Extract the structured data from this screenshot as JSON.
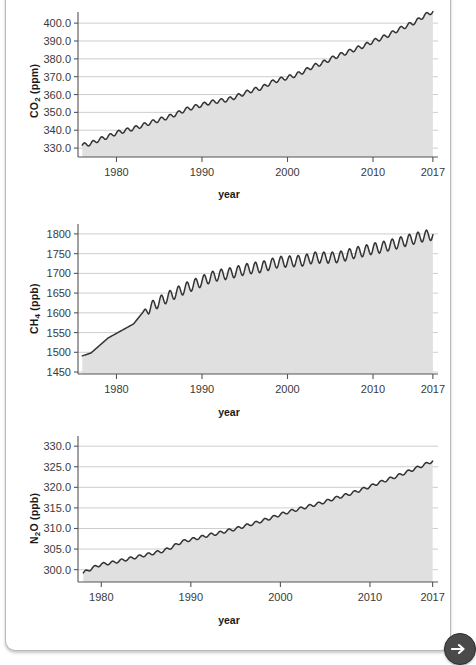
{
  "page": {
    "clipped_heading": "Atmospheric concentrations of carbon dioxide (CO2), methane (CH4) and nitrous oxide (N2O)",
    "next_button_label": "Next",
    "next_icon": "arrow-right-icon",
    "colors": {
      "area_fill": "#e0e0e0",
      "line": "#333333",
      "grid": "#c8c8c8",
      "axis": "#555555",
      "text": "#3a3a3a",
      "button_bg": "#4a4a4a"
    }
  },
  "chart_data": [
    {
      "id": "co2",
      "type": "area",
      "title": "",
      "ylabel": "CO2 (ppm)",
      "ylabel_html": "CO<sub>2</sub> (ppm)",
      "xlabel": "year",
      "unit": "ppm",
      "xlim": [
        1975.5,
        2017.6
      ],
      "ylim": [
        325.0,
        404.0
      ],
      "xticks": [
        1980,
        1990,
        2000,
        2010,
        2017
      ],
      "yticks": [
        330.0,
        340.0,
        350.0,
        360.0,
        370.0,
        380.0,
        390.0,
        400.0
      ],
      "ytick_labels": [
        "330.0",
        "340.0",
        "350.0",
        "360.0",
        "370.0",
        "380.0",
        "390.0",
        "400.0"
      ],
      "xtick_labels": [
        "1980",
        "1990",
        "2000",
        "2010",
        "2017"
      ],
      "grid": true,
      "seasonal_amplitude": 1.1,
      "x": [
        1976.0,
        1977.0,
        1978.0,
        1979.0,
        1980.0,
        1981.0,
        1982.0,
        1983.0,
        1984.0,
        1985.0,
        1986.0,
        1987.0,
        1988.0,
        1989.0,
        1990.0,
        1991.0,
        1992.0,
        1993.0,
        1994.0,
        1995.0,
        1996.0,
        1997.0,
        1998.0,
        1999.0,
        2000.0,
        2001.0,
        2002.0,
        2003.0,
        2004.0,
        2005.0,
        2006.0,
        2007.0,
        2008.0,
        2009.0,
        2010.0,
        2011.0,
        2012.0,
        2013.0,
        2014.0,
        2015.0,
        2016.0,
        2017.0
      ],
      "values": [
        331.6,
        332.5,
        334.8,
        336.4,
        338.5,
        339.8,
        341.0,
        342.6,
        344.3,
        345.8,
        347.3,
        349.1,
        351.4,
        352.9,
        354.2,
        355.6,
        356.4,
        357.1,
        358.8,
        360.8,
        362.6,
        363.7,
        366.6,
        368.3,
        369.5,
        371.0,
        373.2,
        375.8,
        377.5,
        379.8,
        381.9,
        383.7,
        385.6,
        387.4,
        389.8,
        391.6,
        393.8,
        396.5,
        398.6,
        400.8,
        404.2,
        406.5
      ]
    },
    {
      "id": "ch4",
      "type": "area",
      "title": "",
      "ylabel": "CH4 (ppb)",
      "ylabel_html": "CH<sub>4</sub> (ppb)",
      "xlabel": "year",
      "unit": "ppb",
      "xlim": [
        1975.5,
        2017.6
      ],
      "ylim": [
        1445.0,
        1815.0
      ],
      "xticks": [
        1980,
        1990,
        2000,
        2010,
        2017
      ],
      "yticks": [
        1450,
        1500,
        1550,
        1600,
        1650,
        1700,
        1750,
        1800
      ],
      "ytick_labels": [
        "1450",
        "1500",
        "1550",
        "1600",
        "1650",
        "1700",
        "1750",
        "1800"
      ],
      "xtick_labels": [
        "1980",
        "1990",
        "2000",
        "2010",
        "2017"
      ],
      "grid": true,
      "seasonal_amplitude": 14.0,
      "seasonal_start_year": 1983.0,
      "x": [
        1976.0,
        1977.0,
        1978.0,
        1979.0,
        1980.0,
        1981.0,
        1982.0,
        1983.0,
        1984.0,
        1985.0,
        1986.0,
        1987.0,
        1988.0,
        1989.0,
        1990.0,
        1991.0,
        1992.0,
        1993.0,
        1994.0,
        1995.0,
        1996.0,
        1997.0,
        1998.0,
        1999.0,
        2000.0,
        2001.0,
        2002.0,
        2003.0,
        2004.0,
        2005.0,
        2006.0,
        2007.0,
        2008.0,
        2009.0,
        2010.0,
        2011.0,
        2012.0,
        2013.0,
        2014.0,
        2015.0,
        2016.0,
        2017.0
      ],
      "values": [
        1491.0,
        1498.0,
        1517.0,
        1536.0,
        1548.0,
        1560.0,
        1572.0,
        1599.0,
        1614.0,
        1628.0,
        1640.0,
        1651.0,
        1662.0,
        1671.0,
        1680.0,
        1690.0,
        1696.0,
        1699.0,
        1704.0,
        1710.0,
        1714.0,
        1716.0,
        1723.0,
        1729.0,
        1730.0,
        1731.0,
        1733.0,
        1740.0,
        1740.0,
        1740.0,
        1741.0,
        1747.0,
        1753.0,
        1757.0,
        1763.0,
        1766.0,
        1772.0,
        1777.0,
        1784.0,
        1789.0,
        1795.0,
        1798.0
      ]
    },
    {
      "id": "n2o",
      "type": "area",
      "title": "",
      "ylabel": "N2O (ppb)",
      "ylabel_html": "N<sub>2</sub>O (ppb)",
      "xlabel": "year",
      "unit": "ppb",
      "xlim": [
        1977.4,
        2017.6
      ],
      "ylim": [
        297.0,
        331.5
      ],
      "xticks": [
        1980,
        1990,
        2000,
        2010,
        2017
      ],
      "yticks": [
        300.0,
        305.0,
        310.0,
        315.0,
        320.0,
        325.0,
        330.0
      ],
      "ytick_labels": [
        "300.0",
        "305.0",
        "310.0",
        "315.0",
        "320.0",
        "325.0",
        "330.0"
      ],
      "xtick_labels": [
        "1980",
        "1990",
        "2000",
        "2010",
        "2017"
      ],
      "grid": true,
      "seasonal_amplitude": 0.35,
      "x": [
        1978.0,
        1979.0,
        1980.0,
        1981.0,
        1982.0,
        1983.0,
        1984.0,
        1985.0,
        1986.0,
        1987.0,
        1988.0,
        1989.0,
        1990.0,
        1991.0,
        1992.0,
        1993.0,
        1994.0,
        1995.0,
        1996.0,
        1997.0,
        1998.0,
        1999.0,
        2000.0,
        2001.0,
        2002.0,
        2003.0,
        2004.0,
        2005.0,
        2006.0,
        2007.0,
        2008.0,
        2009.0,
        2010.0,
        2011.0,
        2012.0,
        2013.0,
        2014.0,
        2015.0,
        2016.0,
        2017.0
      ],
      "values": [
        299.2,
        300.4,
        301.3,
        301.6,
        302.1,
        302.6,
        303.1,
        303.6,
        304.1,
        304.6,
        305.6,
        306.8,
        307.3,
        307.8,
        308.4,
        308.8,
        309.4,
        309.9,
        310.6,
        311.2,
        311.9,
        312.6,
        313.4,
        314.1,
        314.7,
        315.3,
        315.9,
        316.5,
        317.3,
        317.9,
        318.6,
        319.4,
        320.2,
        321.1,
        321.9,
        322.7,
        323.6,
        324.5,
        325.4,
        326.4
      ]
    }
  ]
}
